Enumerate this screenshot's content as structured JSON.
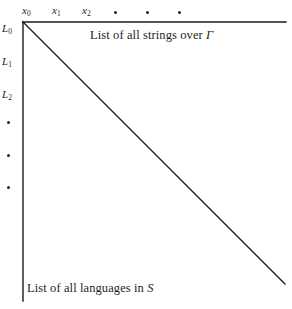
{
  "figure": {
    "title_top": "List of all strings over Γ",
    "title_bottom": "List of all languages in S",
    "column_headers": [
      {
        "name": "x0",
        "base": "x",
        "sub": "0",
        "x": 22,
        "y": 5
      },
      {
        "name": "x1",
        "base": "x",
        "sub": "1",
        "x": 52,
        "y": 5
      },
      {
        "name": "x2",
        "base": "x",
        "sub": "2",
        "x": 82,
        "y": 5
      }
    ],
    "column_ellipsis_dots": [
      {
        "x": 114,
        "y": 11
      },
      {
        "x": 146,
        "y": 11
      },
      {
        "x": 178,
        "y": 11
      }
    ],
    "row_headers": [
      {
        "name": "L0",
        "base": "L",
        "sub": "0",
        "x": 2,
        "y": 23
      },
      {
        "name": "L1",
        "base": "L",
        "sub": "1",
        "x": 2,
        "y": 56
      },
      {
        "name": "L2",
        "base": "L",
        "sub": "2",
        "x": 2,
        "y": 89
      }
    ],
    "row_ellipsis_dots": [
      {
        "x": 7,
        "y": 121
      },
      {
        "x": 7,
        "y": 154
      },
      {
        "x": 7,
        "y": 186
      }
    ],
    "top_caption": {
      "text_plain": "List of all strings over ",
      "symbol": "Γ",
      "x": 90,
      "y": 29
    },
    "bottom_caption": {
      "text_plain": "List of all languages in ",
      "symbol": "S",
      "x": 27,
      "y": 282
    },
    "geometry": {
      "origin_x": 23,
      "origin_y": 22,
      "horizontal_axis_end_x": 286,
      "vertical_axis_end_y": 301,
      "diagonal_end_x": 285,
      "diagonal_end_y": 284
    },
    "colors": {
      "background": "#ffffff",
      "ink": "#231f20",
      "line": "#1a1a1a"
    },
    "stroke_widths": {
      "axis": 1.4,
      "diagonal": 1.3
    }
  }
}
